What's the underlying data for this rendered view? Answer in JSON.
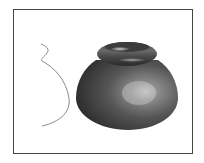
{
  "figure": {
    "frame_color": "#444444",
    "profile_curve": {
      "color": "#888888",
      "label": ""
    },
    "revolved_surface": {
      "body_color_dark": "#2e2e2e",
      "body_color_mid": "#5a5a5a",
      "highlight_color": "#b8b8b8",
      "lip_color": "#4a4a4a"
    }
  }
}
